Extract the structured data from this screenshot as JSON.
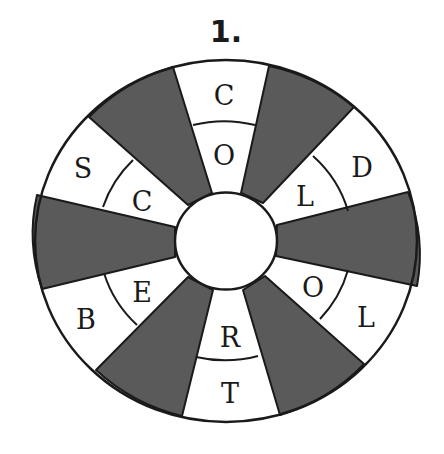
{
  "puzzle": {
    "number_label": "1.",
    "colors": {
      "dark_sector": "#5a5a5a",
      "line": "#1a1a1a",
      "light_sector": "#ffffff"
    },
    "sectors": [
      {
        "position": "top",
        "outer": "C",
        "inner": "O"
      },
      {
        "position": "upper-right",
        "outer": "D",
        "inner": "L"
      },
      {
        "position": "lower-right",
        "outer": "L",
        "inner": "O"
      },
      {
        "position": "bottom",
        "outer": "T",
        "inner": "R"
      },
      {
        "position": "lower-left",
        "outer": "B",
        "inner": "E"
      },
      {
        "position": "upper-left",
        "outer": "S",
        "inner": "C"
      }
    ]
  }
}
